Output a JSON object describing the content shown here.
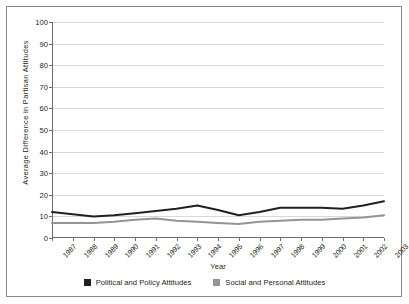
{
  "chart_data": {
    "type": "line",
    "title": "",
    "xlabel": "Year",
    "ylabel": "Average  Difference in Partisan Attitudes",
    "ylim": [
      0,
      100
    ],
    "ytick_step": 10,
    "yticks": [
      0,
      10,
      20,
      30,
      40,
      50,
      60,
      70,
      80,
      90,
      100
    ],
    "grid": "horizontal",
    "legend_position": "bottom",
    "categories": [
      "1987",
      "1988",
      "1989",
      "1990",
      "1991",
      "1992",
      "1993",
      "1994",
      "1995",
      "1996",
      "1997",
      "1998",
      "1999",
      "2000",
      "2001",
      "2002",
      "2003"
    ],
    "series": [
      {
        "name": "Political and Policy Attitudes",
        "color": "#231f20",
        "values": [
          12,
          11,
          10,
          10.5,
          11.5,
          12.5,
          13.5,
          15,
          13,
          10.5,
          12,
          14,
          14,
          14,
          13.5,
          15,
          17
        ]
      },
      {
        "name": "Social and Personal Attitudes",
        "color": "#929497",
        "values": [
          7,
          7,
          7,
          7.5,
          8.5,
          9,
          8,
          7.5,
          7,
          6.5,
          7.5,
          8,
          8.5,
          8.5,
          9,
          9.5,
          10.5
        ]
      }
    ]
  },
  "figure": {
    "frame_color": "#8a8a8a",
    "axis_color": "#6d6d6d",
    "grid_color": "#d8d8d8"
  }
}
